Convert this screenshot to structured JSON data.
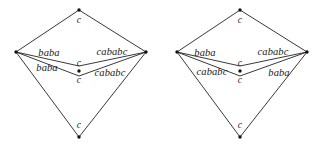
{
  "figure": {
    "background_color": "#ffffff",
    "line_color": "#222222",
    "text_color": "#1a1a1a",
    "diagrams": [
      {
        "id": "left-diagram",
        "vertices": [
          {
            "name": "top",
            "x": 79,
            "y": 10,
            "label": "c",
            "label_x": 79,
            "label_y": 21
          },
          {
            "name": "left",
            "x": 16,
            "y": 52,
            "label": "",
            "label_x": 0,
            "label_y": 0
          },
          {
            "name": "right",
            "x": 146,
            "y": 52,
            "label": "",
            "label_x": 0,
            "label_y": 0
          },
          {
            "name": "center",
            "x": 79,
            "y": 72,
            "label": "c",
            "label_x": 79,
            "label_y": 64
          },
          {
            "name": "center-lower",
            "x": 79,
            "y": 72,
            "label": "c",
            "label_x": 79,
            "label_y": 81
          },
          {
            "name": "bottom",
            "x": 79,
            "y": 137,
            "label": "c",
            "label_x": 79,
            "label_y": 126
          }
        ],
        "edges": [
          {
            "name": "top-left-edge",
            "from": "left",
            "to": "top",
            "label": "",
            "label_x": 0,
            "label_y": 0
          },
          {
            "name": "top-right-edge",
            "from": "top",
            "to": "right",
            "label": "",
            "label_x": 0,
            "label_y": 0
          },
          {
            "name": "upper-left-edge",
            "from": "left",
            "to": "center",
            "label": "baba",
            "label_x": 49,
            "label_y": 53
          },
          {
            "name": "upper-right-edge",
            "from": "center",
            "to": "right",
            "label": "cababc",
            "label_x": 112,
            "label_y": 52
          },
          {
            "name": "lower-left-edge",
            "from": "left",
            "to": "center",
            "label": "baba",
            "label_x": 47,
            "label_y": 68
          },
          {
            "name": "lower-right-edge",
            "from": "center",
            "to": "right",
            "label": "cababc",
            "label_x": 110,
            "label_y": 73
          },
          {
            "name": "bottom-left-edge",
            "from": "left",
            "to": "bottom",
            "label": "",
            "label_x": 0,
            "label_y": 0
          },
          {
            "name": "bottom-right-edge",
            "from": "right",
            "to": "bottom",
            "label": "",
            "label_x": 0,
            "label_y": 0
          }
        ]
      },
      {
        "id": "right-diagram",
        "vertices": [
          {
            "name": "top",
            "x": 240,
            "y": 10,
            "label": "c",
            "label_x": 240,
            "label_y": 21
          },
          {
            "name": "left",
            "x": 177,
            "y": 52,
            "label": "",
            "label_x": 0,
            "label_y": 0
          },
          {
            "name": "right",
            "x": 307,
            "y": 52,
            "label": "",
            "label_x": 0,
            "label_y": 0
          },
          {
            "name": "center",
            "x": 240,
            "y": 72,
            "label": "c",
            "label_x": 240,
            "label_y": 64
          },
          {
            "name": "center-lower",
            "x": 240,
            "y": 72,
            "label": "c",
            "label_x": 240,
            "label_y": 81
          },
          {
            "name": "bottom",
            "x": 240,
            "y": 137,
            "label": "c",
            "label_x": 240,
            "label_y": 126
          }
        ],
        "edges": [
          {
            "name": "top-left-edge",
            "from": "left",
            "to": "top",
            "label": "",
            "label_x": 0,
            "label_y": 0
          },
          {
            "name": "top-right-edge",
            "from": "top",
            "to": "right",
            "label": "",
            "label_x": 0,
            "label_y": 0
          },
          {
            "name": "upper-left-edge",
            "from": "left",
            "to": "center",
            "label": "baba",
            "label_x": 205,
            "label_y": 53
          },
          {
            "name": "upper-right-edge",
            "from": "center",
            "to": "right",
            "label": "cababc",
            "label_x": 273,
            "label_y": 52
          },
          {
            "name": "lower-left-edge",
            "from": "left",
            "to": "center",
            "label": "cababc",
            "label_x": 212,
            "label_y": 72
          },
          {
            "name": "lower-right-edge",
            "from": "center",
            "to": "right",
            "label": "baba",
            "label_x": 279,
            "label_y": 73
          },
          {
            "name": "bottom-left-edge",
            "from": "left",
            "to": "bottom",
            "label": "",
            "label_x": 0,
            "label_y": 0
          },
          {
            "name": "bottom-right-edge",
            "from": "right",
            "to": "bottom",
            "label": "",
            "label_x": 0,
            "label_y": 0
          }
        ]
      }
    ]
  }
}
